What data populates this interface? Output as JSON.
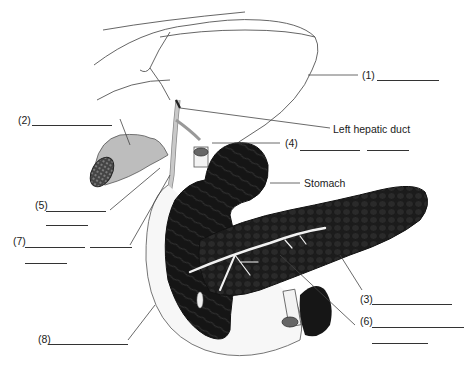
{
  "diagram": {
    "labels": [
      {
        "id": "1",
        "text": "(1)"
      },
      {
        "id": "2",
        "text": "(2)"
      },
      {
        "id": "3",
        "text": "(3)"
      },
      {
        "id": "4",
        "text": "(4)"
      },
      {
        "id": "5",
        "text": "(5)"
      },
      {
        "id": "6",
        "text": "(6)"
      },
      {
        "id": "7",
        "text": "(7)"
      },
      {
        "id": "8",
        "text": "(8)"
      }
    ],
    "named_labels": {
      "left_hepatic_duct": "Left hepatic duct",
      "stomach": "Stomach"
    }
  }
}
